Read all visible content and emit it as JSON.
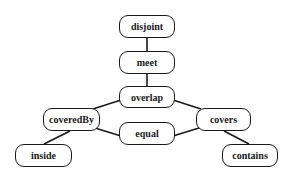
{
  "diagram": {
    "type": "lattice",
    "nodes": [
      {
        "id": "disjoint",
        "label": "disjoint",
        "x": 119,
        "y": 15,
        "w": 56,
        "h": 23
      },
      {
        "id": "meet",
        "label": "meet",
        "x": 119,
        "y": 51,
        "w": 56,
        "h": 23
      },
      {
        "id": "overlap",
        "label": "overlap",
        "x": 119,
        "y": 86,
        "w": 56,
        "h": 22
      },
      {
        "id": "coveredBy",
        "label": "coveredBy",
        "x": 43,
        "y": 108,
        "w": 57,
        "h": 23
      },
      {
        "id": "covers",
        "label": "covers",
        "x": 196,
        "y": 108,
        "w": 55,
        "h": 23
      },
      {
        "id": "equal",
        "label": "equal",
        "x": 119,
        "y": 122,
        "w": 56,
        "h": 23
      },
      {
        "id": "inside",
        "label": "inside",
        "x": 15,
        "y": 144,
        "w": 57,
        "h": 23
      },
      {
        "id": "contains",
        "label": "contains",
        "x": 222,
        "y": 144,
        "w": 56,
        "h": 23
      }
    ],
    "edges": [
      {
        "from": "disjoint",
        "to": "meet",
        "x1": 147,
        "y1": 38,
        "x2": 147,
        "y2": 51
      },
      {
        "from": "meet",
        "to": "overlap",
        "x1": 147,
        "y1": 74,
        "x2": 147,
        "y2": 86
      },
      {
        "from": "overlap",
        "to": "coveredBy",
        "x1": 121,
        "y1": 100,
        "x2": 93,
        "y2": 109
      },
      {
        "from": "overlap",
        "to": "covers",
        "x1": 173,
        "y1": 100,
        "x2": 201,
        "y2": 109
      },
      {
        "from": "coveredBy",
        "to": "equal",
        "x1": 95,
        "y1": 128,
        "x2": 121,
        "y2": 136
      },
      {
        "from": "covers",
        "to": "equal",
        "x1": 199,
        "y1": 128,
        "x2": 173,
        "y2": 136
      },
      {
        "from": "coveredBy",
        "to": "inside",
        "x1": 70,
        "y1": 131,
        "x2": 44,
        "y2": 144
      },
      {
        "from": "covers",
        "to": "contains",
        "x1": 224,
        "y1": 131,
        "x2": 249,
        "y2": 144
      }
    ]
  }
}
